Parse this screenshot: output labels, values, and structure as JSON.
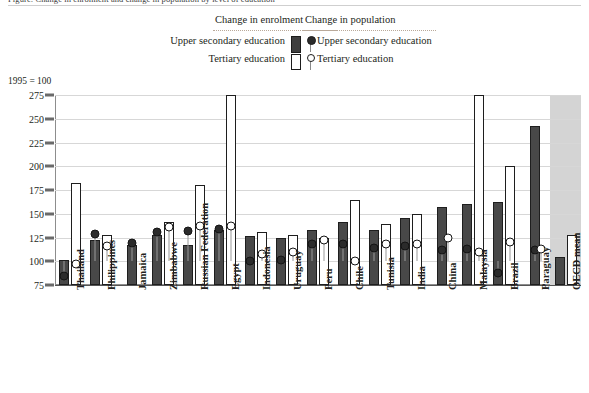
{
  "top_title": "Figure: Change in enrolment and change in population by level of education",
  "legend": {
    "head_enrolment": "Change in enrolment",
    "head_population": "Change in population",
    "enrolment_upper": "Upper secondary education",
    "enrolment_tertiary": "Tertiary education",
    "population_upper": "Upper secondary education",
    "population_tertiary": "Tertiary education",
    "swatch_dark_name": "filled-bar-swatch",
    "swatch_white_name": "open-bar-swatch",
    "swatch_dot_dark_name": "filled-dot-marker",
    "swatch_dot_open_name": "open-dot-marker"
  },
  "axis_note": "1995 = 100",
  "colors": {
    "bar_dark": "#484848",
    "bar_white": "#ffffff",
    "outline": "#1e1e1e",
    "grid": "#d7d7d7",
    "oecd_band": "#d4d4d4",
    "stem": "#9a9a9a",
    "text": "#231f20"
  },
  "chart_data": {
    "type": "bar",
    "title": "Change in enrolment and change in population",
    "subtitle": "1995 = 100",
    "xlabel": "",
    "ylabel": "1995 = 100",
    "ylim": [
      75,
      275
    ],
    "yticks": [
      75,
      100,
      125,
      150,
      175,
      200,
      225,
      250,
      275
    ],
    "grid": true,
    "legend_position": "top",
    "categories": [
      "Thailand",
      "Philippines",
      "Jamaica",
      "Zimbabwe",
      "Russian Federation",
      "Egypt",
      "Indonesia",
      "Uruguay",
      "Peru",
      "Chile",
      "Tunisia",
      "India",
      "China",
      "Malaysia",
      "Brazil",
      "Paraguay",
      "OECD mean"
    ],
    "series": [
      {
        "name": "Change in enrolment — Upper secondary education",
        "kind": "bar",
        "style": "filled",
        "values": [
          101,
          122,
          117,
          128,
          117,
          133,
          127,
          124,
          133,
          141,
          133,
          146,
          157,
          160,
          162,
          242,
          105
        ]
      },
      {
        "name": "Change in enrolment — Tertiary education",
        "kind": "bar",
        "style": "open",
        "values": [
          182,
          128,
          null,
          141,
          180,
          275,
          131,
          128,
          124,
          165,
          139,
          150,
          null,
          275,
          200,
          null,
          128
        ]
      },
      {
        "name": "Change in population — Upper secondary education",
        "kind": "marker",
        "style": "filled-dot",
        "values": [
          85,
          129,
          119,
          131,
          132,
          134,
          100,
          101,
          118,
          118,
          114,
          116,
          112,
          113,
          88,
          112,
          null
        ]
      },
      {
        "name": "Change in population — Tertiary education",
        "kind": "marker",
        "style": "open-dot",
        "values": [
          97,
          116,
          null,
          136,
          137,
          137,
          108,
          110,
          122,
          100,
          118,
          118,
          125,
          110,
          120,
          113,
          null
        ]
      }
    ]
  }
}
